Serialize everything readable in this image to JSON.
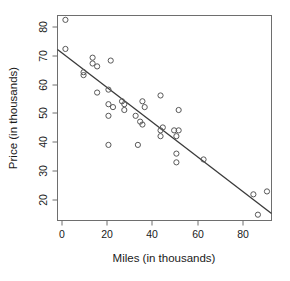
{
  "chart_data": {
    "type": "scatter",
    "title": "",
    "xlabel": "Miles (in thousands)",
    "ylabel": "Price (in thousands)",
    "xlim": [
      -2.5,
      92
    ],
    "ylim": [
      14,
      84.5
    ],
    "xticks": [
      0,
      20,
      40,
      60,
      80
    ],
    "yticks": [
      20,
      30,
      40,
      50,
      60,
      70,
      80
    ],
    "grid": false,
    "legend": null,
    "point_marker": "open-circle",
    "point_color": "#585858",
    "line_color": "#3a3a3a",
    "frame_color": "#6e6e6e",
    "x": [
      1,
      1,
      9,
      9,
      13,
      13,
      15,
      15,
      20,
      20,
      20,
      20,
      21,
      22,
      26,
      27,
      27,
      32,
      33,
      34,
      35,
      35,
      36,
      43,
      43,
      43,
      44,
      49,
      50,
      50,
      50,
      51,
      51,
      62,
      84,
      86,
      90
    ],
    "y": [
      83,
      73,
      65,
      64,
      68,
      70,
      67,
      58,
      59,
      54,
      50,
      40,
      69,
      53,
      55,
      52,
      54,
      50,
      40,
      48,
      47,
      55,
      53,
      57,
      45,
      43,
      46,
      45,
      37,
      34,
      43,
      52,
      45,
      35,
      23,
      16,
      24
    ],
    "series": [
      {
        "name": "observations",
        "points": [
          [
            1,
            83
          ],
          [
            1,
            73
          ],
          [
            9,
            65
          ],
          [
            9,
            64
          ],
          [
            13,
            68
          ],
          [
            13,
            70
          ],
          [
            15,
            67
          ],
          [
            15,
            58
          ],
          [
            20,
            59
          ],
          [
            20,
            54
          ],
          [
            20,
            50
          ],
          [
            20,
            40
          ],
          [
            21,
            69
          ],
          [
            22,
            53
          ],
          [
            26,
            55
          ],
          [
            27,
            52
          ],
          [
            27,
            54
          ],
          [
            32,
            50
          ],
          [
            33,
            40
          ],
          [
            34,
            48
          ],
          [
            35,
            47
          ],
          [
            35,
            55
          ],
          [
            36,
            53
          ],
          [
            43,
            57
          ],
          [
            43,
            45
          ],
          [
            43,
            43
          ],
          [
            44,
            46
          ],
          [
            49,
            45
          ],
          [
            50,
            37
          ],
          [
            50,
            34
          ],
          [
            50,
            43
          ],
          [
            51,
            52
          ],
          [
            51,
            45
          ],
          [
            62,
            35
          ],
          [
            84,
            23
          ],
          [
            86,
            16
          ],
          [
            90,
            24
          ]
        ]
      }
    ],
    "fit_line": {
      "name": "least-squares regression line",
      "x_start": -2.5,
      "y_start": 72.8,
      "x_end": 92,
      "y_end": 16.4
    }
  }
}
